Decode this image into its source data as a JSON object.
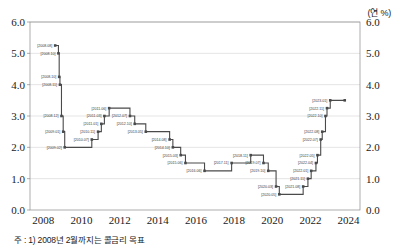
{
  "unit": {
    "label": "(연 %)"
  },
  "footnote": {
    "text": "주 : 1) 2008년 2월까지는 콜금리 목표"
  },
  "axes": {
    "y_ticks": [
      "0.0",
      "1.0",
      "2.0",
      "3.0",
      "4.0",
      "5.0",
      "6.0"
    ],
    "x_ticks": [
      "2008",
      "2010",
      "2012",
      "2014",
      "2016",
      "2018",
      "2020",
      "2022",
      "2024"
    ]
  },
  "chart_data": {
    "type": "line",
    "title": "",
    "xlabel": "",
    "ylabel": "",
    "unit": "연 %",
    "line_style": "step-post",
    "marker": "square",
    "grid": "horizontal",
    "legend": "none",
    "xlim": [
      2007.3,
      2024.6
    ],
    "ylim": [
      0.0,
      6.0
    ],
    "y_ticks": [
      0.0,
      1.0,
      2.0,
      3.0,
      4.0,
      5.0,
      6.0
    ],
    "x_ticks": [
      2008,
      2010,
      2012,
      2014,
      2016,
      2018,
      2020,
      2022,
      2024
    ],
    "series_name": "한국은행 기준금리",
    "points": [
      {
        "date": "2008.08",
        "x": 2008.62,
        "y": 5.25,
        "label": "[2008.08]",
        "label_pos": "left"
      },
      {
        "date": "2008.10",
        "x": 2008.79,
        "y": 5.0,
        "label": "[2008.10]",
        "label_pos": "left"
      },
      {
        "date": "2008.10",
        "x": 2008.83,
        "y": 4.25,
        "label": "[2008.10]",
        "label_pos": "left"
      },
      {
        "date": "2008.11",
        "x": 2008.87,
        "y": 4.0,
        "label": "[2008.11]",
        "label_pos": "left"
      },
      {
        "date": "2008.12",
        "x": 2008.95,
        "y": 3.0,
        "label": "[2008.12]",
        "label_pos": "left"
      },
      {
        "date": "2009.01",
        "x": 2009.04,
        "y": 2.5,
        "label": "[2009.01]",
        "label_pos": "left"
      },
      {
        "date": "2009.02",
        "x": 2009.12,
        "y": 2.0,
        "label": "[2009.02]",
        "label_pos": "left"
      },
      {
        "date": "2010.07",
        "x": 2010.54,
        "y": 2.25,
        "label": "[2010.07]",
        "label_pos": "left"
      },
      {
        "date": "2010.11",
        "x": 2010.87,
        "y": 2.5,
        "label": "[2010.11]",
        "label_pos": "left"
      },
      {
        "date": "2011.01",
        "x": 2011.04,
        "y": 2.75,
        "label": "[2011.01]",
        "label_pos": "left"
      },
      {
        "date": "2011.03",
        "x": 2011.2,
        "y": 3.0,
        "label": "[2011.03]",
        "label_pos": "left"
      },
      {
        "date": "2011.06",
        "x": 2011.45,
        "y": 3.25,
        "label": "[2011.06]",
        "label_pos": "left"
      },
      {
        "date": "2012.07",
        "x": 2012.54,
        "y": 3.0,
        "label": "[2012.07]",
        "label_pos": "left"
      },
      {
        "date": "2012.10",
        "x": 2012.79,
        "y": 2.75,
        "label": "[2012.10]",
        "label_pos": "left"
      },
      {
        "date": "2013.05",
        "x": 2013.37,
        "y": 2.5,
        "label": "[2013.05]",
        "label_pos": "left"
      },
      {
        "date": "2014.08",
        "x": 2014.62,
        "y": 2.25,
        "label": "[2014.08]",
        "label_pos": "left"
      },
      {
        "date": "2014.10",
        "x": 2014.79,
        "y": 2.0,
        "label": "[2014.10]",
        "label_pos": "left"
      },
      {
        "date": "2015.03",
        "x": 2015.2,
        "y": 1.75,
        "label": "[2015.03]",
        "label_pos": "left"
      },
      {
        "date": "2015.06",
        "x": 2015.45,
        "y": 1.5,
        "label": "[2015.06]",
        "label_pos": "left"
      },
      {
        "date": "2016.06",
        "x": 2016.45,
        "y": 1.25,
        "label": "[2016.06]",
        "label_pos": "left"
      },
      {
        "date": "2017.11",
        "x": 2017.87,
        "y": 1.5,
        "label": "[2017.11]",
        "label_pos": "left"
      },
      {
        "date": "2018.11",
        "x": 2018.87,
        "y": 1.75,
        "label": "[2018.11]",
        "label_pos": "left"
      },
      {
        "date": "2019.07",
        "x": 2019.54,
        "y": 1.5,
        "label": "[2019.07]",
        "label_pos": "left"
      },
      {
        "date": "2019.10",
        "x": 2019.79,
        "y": 1.25,
        "label": "[2019.10]",
        "label_pos": "left"
      },
      {
        "date": "2020.03",
        "x": 2020.2,
        "y": 0.75,
        "label": "[2020.03]",
        "label_pos": "left"
      },
      {
        "date": "2020.05",
        "x": 2020.37,
        "y": 0.5,
        "label": "[2020.05]",
        "label_pos": "left"
      },
      {
        "date": "2021.08",
        "x": 2021.62,
        "y": 0.75,
        "label": "[2021.08]",
        "label_pos": "left"
      },
      {
        "date": "2021.11",
        "x": 2021.87,
        "y": 1.0,
        "label": "[2021.11]",
        "label_pos": "left"
      },
      {
        "date": "2022.01",
        "x": 2022.04,
        "y": 1.25,
        "label": "[2022.01]",
        "label_pos": "left"
      },
      {
        "date": "2022.04",
        "x": 2022.29,
        "y": 1.5,
        "label": "[2022.04]",
        "label_pos": "left"
      },
      {
        "date": "2022.05",
        "x": 2022.37,
        "y": 1.75,
        "label": "[2022.05]",
        "label_pos": "left"
      },
      {
        "date": "2022.07",
        "x": 2022.54,
        "y": 2.25,
        "label": "[2022.07]",
        "label_pos": "left"
      },
      {
        "date": "2022.08",
        "x": 2022.62,
        "y": 2.5,
        "label": "[2022.08]",
        "label_pos": "left"
      },
      {
        "date": "2022.10",
        "x": 2022.79,
        "y": 3.0,
        "label": "[2022.10]",
        "label_pos": "left"
      },
      {
        "date": "2022.11",
        "x": 2022.87,
        "y": 3.25,
        "label": "[2022.11]",
        "label_pos": "left"
      },
      {
        "date": "2023.01",
        "x": 2023.04,
        "y": 3.5,
        "label": "[2023.01]",
        "label_pos": "left"
      },
      {
        "date": "end",
        "x": 2023.8,
        "y": 3.5,
        "label": "",
        "label_pos": "none"
      }
    ]
  }
}
